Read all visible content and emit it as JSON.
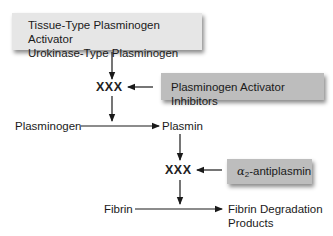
{
  "diagram": {
    "activators_box": {
      "line1": "Tissue-Type Plasminogen Activator",
      "line2": "Urokinase-Type Plasminogen"
    },
    "xxx_upper": "XXX",
    "inhibitors_box": "Plasminogen Activator Inhibitors",
    "plasminogen": "Plasminogen",
    "plasmin": "Plasmin",
    "xxx_lower": "XXX",
    "antiplasmin_box": {
      "alpha": "α",
      "subscript": "2",
      "rest": "-antiplasmin"
    },
    "fibrin": "Fibrin",
    "fdp": {
      "line1": "Fibrin Degradation",
      "line2": "Products"
    },
    "colors": {
      "light_box": "#e6e6e6",
      "dark_box": "#bdbdbd",
      "line": "#1a1a1a"
    }
  }
}
